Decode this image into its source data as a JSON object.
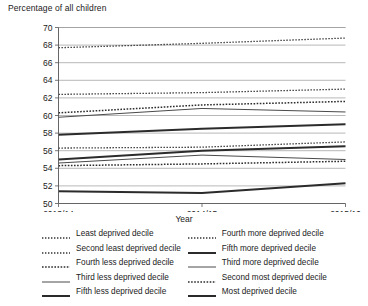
{
  "chart_data": {
    "type": "line",
    "title": "",
    "ylabel": "Percentage of all children",
    "xlabel": "Year",
    "categories": [
      "2013/14",
      "2014/15",
      "2015/16"
    ],
    "ylim": [
      50,
      70
    ],
    "yticks": [
      50,
      52,
      54,
      56,
      58,
      60,
      62,
      64,
      66,
      68,
      70
    ],
    "grid": true,
    "legend_position": "bottom",
    "legend_columns": 2,
    "series": [
      {
        "name": "Least deprived decile",
        "values": [
          67.7,
          68.2,
          68.8
        ],
        "style": "dotted",
        "width": 1.3,
        "color": "#333333",
        "column": "left"
      },
      {
        "name": "Second least deprived decile",
        "values": [
          62.4,
          62.6,
          63.0
        ],
        "style": "dotted",
        "width": 1.3,
        "color": "#333333",
        "column": "left"
      },
      {
        "name": "Fourth less deprived decile",
        "values": [
          60.3,
          61.2,
          61.6
        ],
        "style": "dotted",
        "width": 1.5,
        "color": "#2b2b2b",
        "column": "left"
      },
      {
        "name": "Third less deprived decile",
        "values": [
          59.8,
          60.8,
          60.4
        ],
        "style": "solid",
        "width": 1.0,
        "color": "#4a4a4a",
        "column": "left"
      },
      {
        "name": "Fifth less deprived decile",
        "values": [
          57.8,
          58.5,
          59.0
        ],
        "style": "solid",
        "width": 2.0,
        "color": "#2b2b2b",
        "column": "left"
      },
      {
        "name": "Fourth more deprived decile",
        "values": [
          56.3,
          56.4,
          57.0
        ],
        "style": "dotted",
        "width": 1.3,
        "color": "#333333",
        "column": "right"
      },
      {
        "name": "Fifth more deprived decile",
        "values": [
          55.0,
          56.0,
          56.5
        ],
        "style": "solid",
        "width": 2.0,
        "color": "#2b2b2b",
        "column": "right"
      },
      {
        "name": "Third more deprived decile",
        "values": [
          54.6,
          55.5,
          55.0
        ],
        "style": "solid",
        "width": 1.0,
        "color": "#4a4a4a",
        "column": "right"
      },
      {
        "name": "Second most deprived decile",
        "values": [
          54.3,
          54.5,
          54.8
        ],
        "style": "dotted",
        "width": 1.5,
        "color": "#2b2b2b",
        "column": "right"
      },
      {
        "name": "Most deprived decile",
        "values": [
          51.4,
          51.2,
          52.3
        ],
        "style": "solid",
        "width": 2.0,
        "color": "#2b2b2b",
        "column": "right"
      }
    ]
  }
}
